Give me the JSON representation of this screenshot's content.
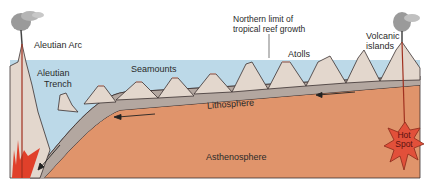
{
  "diagram": {
    "labels": {
      "aleutian_arc": "Aleutian Arc",
      "aleutian_trench_line1": "Aleutian",
      "aleutian_trench_line2": "Trench",
      "seamounts": "Seamounts",
      "northern_limit_line1": "Northern limit of",
      "northern_limit_line2": "tropical reef growth",
      "atolls": "Atolls",
      "volcanic_islands_line1": "Volcanic",
      "volcanic_islands_line2": "islands",
      "lithosphere": "Lithosphere",
      "hot_spot_line1": "Hot",
      "hot_spot_line2": "Spot",
      "asthenosphere": "Asthenosphere"
    },
    "colors": {
      "ocean": "#bcd9e8",
      "lithosphere": "#b3a7a0",
      "asthenosphere": "#e0946b",
      "volcano": "#e3d7cd",
      "magma": "#e0402a",
      "hotspot": "#e2503a",
      "outline": "#3a3030"
    },
    "arrows": [
      {
        "direction": "left",
        "location": "lithosphere-right"
      },
      {
        "direction": "left",
        "location": "lithosphere-middle"
      },
      {
        "direction": "down-left",
        "location": "subducting-slab"
      }
    ]
  }
}
